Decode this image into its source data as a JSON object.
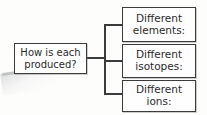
{
  "diagram": {
    "type": "tree-branch",
    "root": {
      "id": "question",
      "text_lines": [
        "How is each",
        "produced?"
      ]
    },
    "branches": [
      {
        "id": "elements",
        "text_lines": [
          "Different",
          "elements:"
        ]
      },
      {
        "id": "isotopes",
        "text_lines": [
          "Different",
          "isotopes:"
        ]
      },
      {
        "id": "ions",
        "text_lines": [
          "Different",
          "ions:"
        ]
      }
    ],
    "colors": {
      "stroke": "#3b3b3b",
      "text": "#2b2b2b",
      "box_fill": "#fefefe",
      "background": "#fdfdfc"
    }
  }
}
